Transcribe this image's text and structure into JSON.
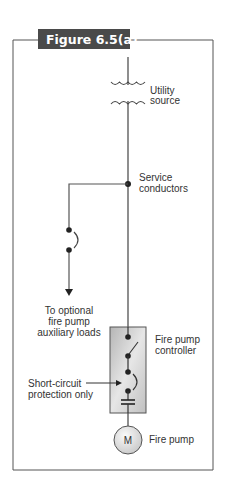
{
  "figure": {
    "title": "Figure 6.5(a)",
    "colors": {
      "frame": "#555555",
      "title_bg": "#4a4a4a",
      "title_text": "#ffffff",
      "line": "#444444",
      "text": "#333333",
      "controller_fill": "#c8c8c8",
      "motor_fill": "#e0e0e0"
    }
  },
  "labels": {
    "utility_source": [
      "Utility",
      "source"
    ],
    "service_conductors": [
      "Service",
      "conductors"
    ],
    "auxiliary_loads": [
      "To optional",
      "fire pump",
      "auxiliary loads"
    ],
    "controller": [
      "Fire pump",
      "controller"
    ],
    "short_circuit": [
      "Short-circuit",
      "protection only"
    ],
    "motor_symbol": "M",
    "fire_pump": "Fire pump"
  }
}
